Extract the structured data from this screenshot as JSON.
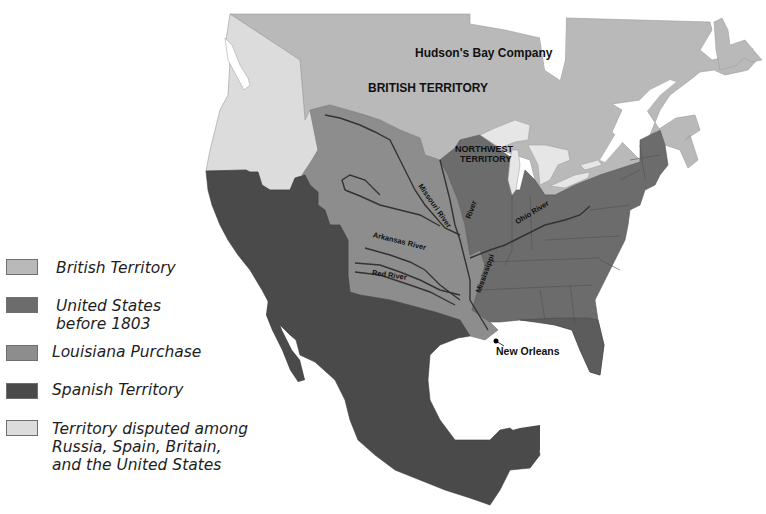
{
  "colors": {
    "british_territory": "#b9b9b9",
    "united_states_before_1803": "#6c6c6c",
    "louisiana_purchase": "#8d8d8d",
    "spanish_territory": "#4a4a4a",
    "disputed_territory": "#dcdcdc",
    "water": "#ffffff",
    "lakes": "#e6e6e6",
    "river": "#3a3a3a"
  },
  "legend": {
    "items": [
      {
        "label": "British Territory",
        "color": "#b9b9b9"
      },
      {
        "label": "United States before 1803",
        "color": "#6c6c6c"
      },
      {
        "label": "Louisiana Purchase",
        "color": "#8d8d8d"
      },
      {
        "label": "Spanish Territory",
        "color": "#4a4a4a"
      },
      {
        "label": "Territory disputed among Russia, Spain, Britain, and the United States",
        "color": "#dcdcdc"
      }
    ]
  },
  "labels": {
    "hudsons_bay": "Hudson's Bay Company",
    "british_territory": "BRITISH TERRITORY",
    "northwest_territory_line1": "NORTHWEST",
    "northwest_territory_line2": "TERRITORY",
    "new_orleans": "New Orleans"
  },
  "rivers": {
    "missouri": "Missouri River",
    "mississippi_upper": "River",
    "mississippi_lower": "Mississippi",
    "arkansas": "Arkansas River",
    "red": "Red River",
    "ohio": "Ohio River"
  }
}
